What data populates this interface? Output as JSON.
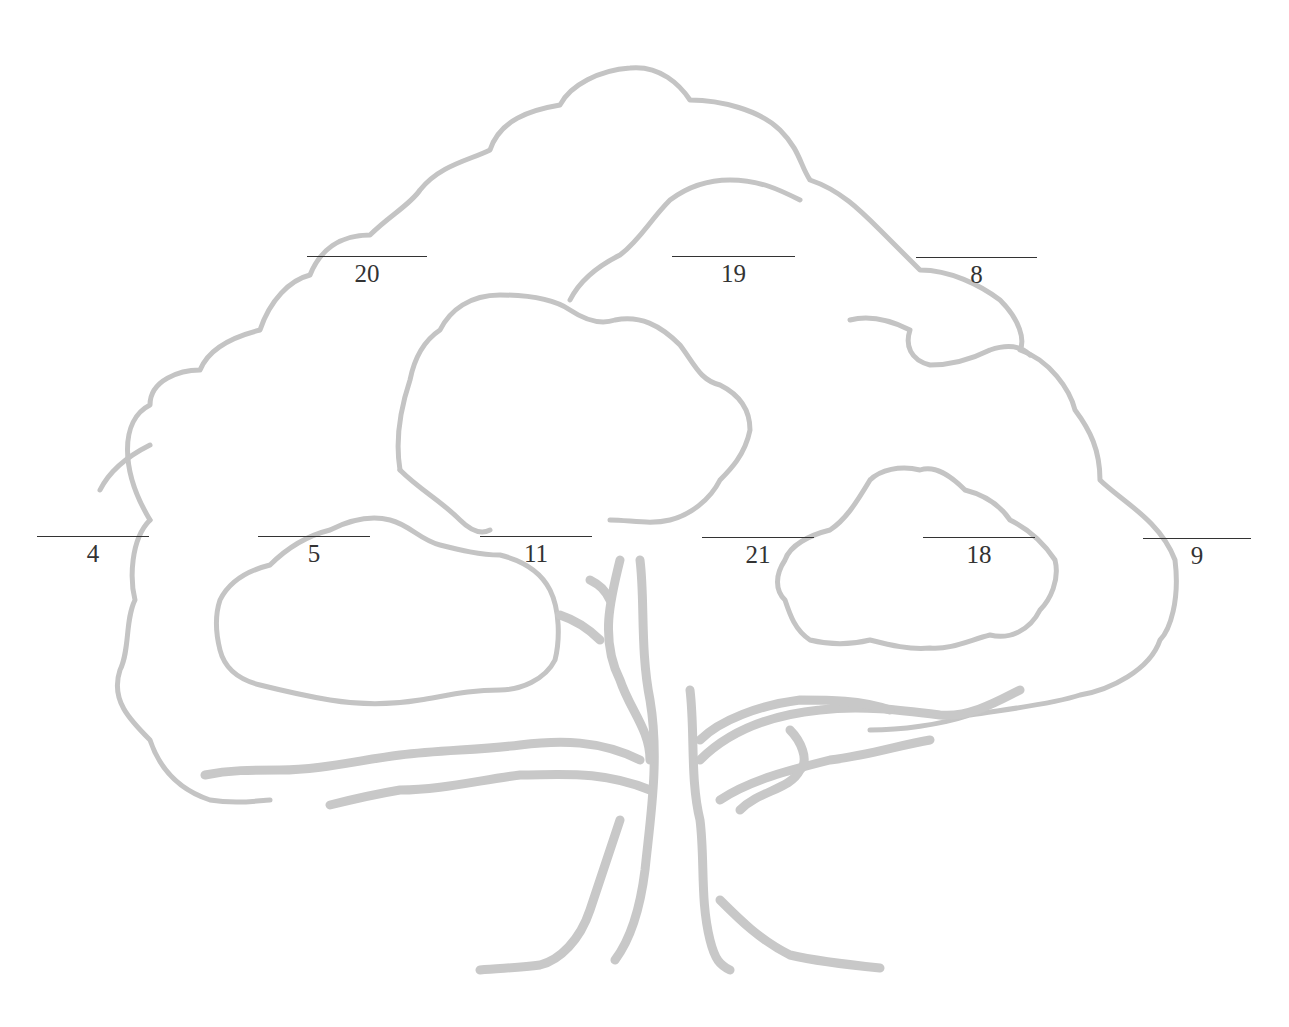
{
  "diagram": {
    "type": "family-tree-worksheet",
    "colors": {
      "tree_outline": "#bdbdbd",
      "line": "#333333",
      "text": "#333333",
      "background": "#ffffff"
    },
    "top_row": [
      {
        "number": "20",
        "x": 307,
        "y": 256
      },
      {
        "number": "19",
        "x": 672,
        "y": 256
      },
      {
        "number": "8",
        "x": 916,
        "y": 257
      }
    ],
    "bottom_row": [
      {
        "number": "4",
        "x": 37,
        "y": 536
      },
      {
        "number": "5",
        "x": 258,
        "y": 536
      },
      {
        "number": "11",
        "x": 480,
        "y": 536
      },
      {
        "number": "21",
        "x": 702,
        "y": 537
      },
      {
        "number": "18",
        "x": 923,
        "y": 537
      },
      {
        "number": "9",
        "x": 1143,
        "y": 538
      }
    ]
  }
}
